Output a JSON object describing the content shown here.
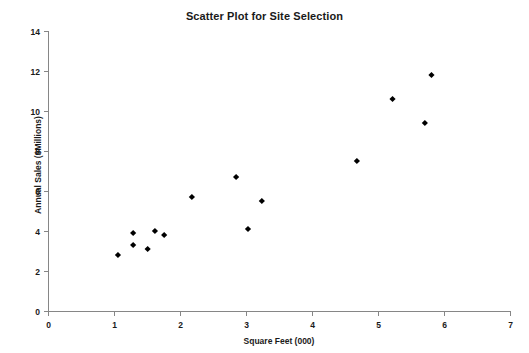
{
  "chart_data": {
    "type": "scatter",
    "title": "Scatter Plot for Site Selection",
    "xlabel": "Square Feet (000)",
    "ylabel": "Annual Sales ($Millions)",
    "xlim": [
      0,
      7
    ],
    "ylim": [
      0,
      14
    ],
    "xticks": [
      0,
      1,
      2,
      3,
      4,
      5,
      6,
      7
    ],
    "yticks": [
      0,
      2,
      4,
      6,
      8,
      10,
      12,
      14
    ],
    "xtick_labels": [
      "0",
      "1",
      "2",
      "3",
      "4",
      "5",
      "6",
      "7"
    ],
    "ytick_labels": [
      "0",
      "2",
      "4",
      "6",
      "8",
      "10",
      "12",
      "14"
    ],
    "grid": false,
    "legend": false,
    "marker": "diamond",
    "marker_color": "#000000",
    "points": [
      {
        "x": 1.06,
        "y": 2.8
      },
      {
        "x": 1.29,
        "y": 3.9
      },
      {
        "x": 1.29,
        "y": 3.3
      },
      {
        "x": 1.51,
        "y": 3.1
      },
      {
        "x": 1.62,
        "y": 4.0
      },
      {
        "x": 1.76,
        "y": 3.8
      },
      {
        "x": 2.18,
        "y": 5.7
      },
      {
        "x": 2.85,
        "y": 6.7
      },
      {
        "x": 3.03,
        "y": 4.1
      },
      {
        "x": 3.24,
        "y": 5.5
      },
      {
        "x": 4.68,
        "y": 7.5
      },
      {
        "x": 5.22,
        "y": 10.6
      },
      {
        "x": 5.71,
        "y": 9.4
      },
      {
        "x": 5.81,
        "y": 11.8
      }
    ]
  }
}
